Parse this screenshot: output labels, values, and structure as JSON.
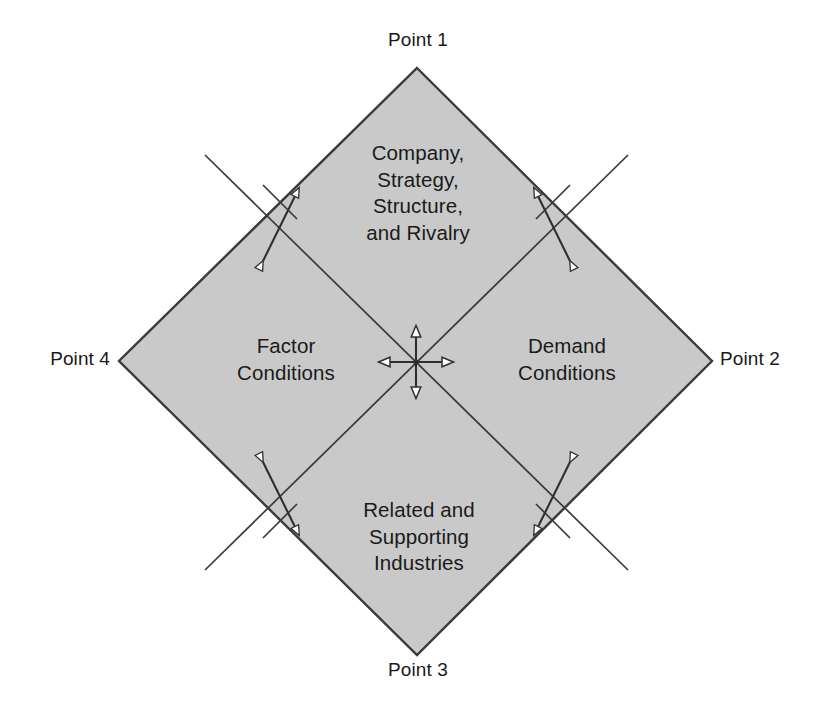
{
  "diagram": {
    "colors": {
      "fill": "#c9c9c9",
      "stroke": "#3a3a3a",
      "text": "#1a1a1a",
      "background": "#ffffff",
      "arrow_fill": "#ffffff"
    },
    "quadrants": [
      {
        "id": "top",
        "name": "company-strategy-structure-rivalry",
        "text": "Company,\nStrategy,\nStructure,\nand Rivalry"
      },
      {
        "id": "left",
        "name": "factor-conditions",
        "text": "Factor\nConditions"
      },
      {
        "id": "right",
        "name": "demand-conditions",
        "text": "Demand\nConditions"
      },
      {
        "id": "bottom",
        "name": "related-supporting-industries",
        "text": "Related and\nSupporting\nIndustries"
      }
    ],
    "points": [
      {
        "id": "point-1",
        "label": "Point 1",
        "position": "top"
      },
      {
        "id": "point-2",
        "label": "Point 2",
        "position": "right"
      },
      {
        "id": "point-3",
        "label": "Point 3",
        "position": "bottom"
      },
      {
        "id": "point-4",
        "label": "Point 4",
        "position": "left"
      }
    ],
    "shape": {
      "type": "diamond",
      "vertices": {
        "top": [
          417,
          68
        ],
        "right": [
          712,
          361
        ],
        "bottom": [
          417,
          655
        ],
        "left": [
          119,
          361
        ]
      },
      "center": [
        416,
        362
      ]
    },
    "arrows": {
      "center": {
        "name": "four-way-arrow",
        "directions": [
          "up",
          "down",
          "left",
          "right"
        ],
        "style": "hollow-triangle"
      },
      "diagonal": [
        {
          "name": "arrow-upper-left",
          "orientation": "ne-sw"
        },
        {
          "name": "arrow-upper-right",
          "orientation": "nw-se"
        },
        {
          "name": "arrow-lower-left",
          "orientation": "nw-se"
        },
        {
          "name": "arrow-lower-right",
          "orientation": "ne-sw"
        }
      ]
    }
  }
}
